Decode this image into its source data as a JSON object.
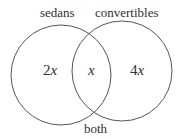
{
  "diagram": {
    "type": "venn",
    "sets": [
      {
        "label": "sedans",
        "region_value": "2x"
      },
      {
        "label": "convertibles",
        "region_value": "4x"
      }
    ],
    "intersection": {
      "label": "both",
      "region_value": "x"
    },
    "colors": {
      "stroke": "#555555",
      "background": "#ffffff"
    }
  },
  "labels": {
    "sedans": "sedans",
    "convertibles": "convertibles",
    "both": "both",
    "left_coef": "2",
    "left_var": "x",
    "middle_var": "x",
    "right_coef": "4",
    "right_var": "x"
  }
}
